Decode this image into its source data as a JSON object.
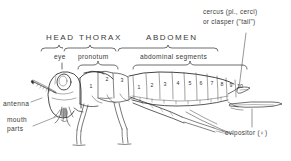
{
  "figure": {
    "background_color": "#ffffff",
    "ink_color": "#2f2f2f"
  },
  "region_labels": [
    {
      "text": "HEAD",
      "x": 46,
      "y": 38
    },
    {
      "text": "THORAX",
      "x": 79,
      "y": 38
    },
    {
      "text": "ABDOMEN",
      "x": 146,
      "y": 38
    }
  ],
  "sub_labels": [
    {
      "text": "eye",
      "x": 57,
      "y": 58
    },
    {
      "text": "pronotum",
      "x": 85,
      "y": 58
    },
    {
      "text": "abdominal segments",
      "x": 140,
      "y": 58
    }
  ],
  "side_labels": [
    {
      "text": "antenna",
      "x": 4,
      "y": 104
    },
    {
      "text": "mouth",
      "x": 8,
      "y": 119
    },
    {
      "text": "parts",
      "x": 8,
      "y": 128
    }
  ],
  "callouts": {
    "cercus_line1": "cercus (pl., cerci)",
    "cercus_line2": "or clasper (\"tail\")",
    "ovipositor": "ovipositor (♀)"
  },
  "thorax_segments": [
    {
      "label": "1",
      "x": 91,
      "y": 86
    },
    {
      "label": "2",
      "x": 107,
      "y": 79
    },
    {
      "label": "3",
      "x": 122,
      "y": 80
    }
  ],
  "abdominal_segments": [
    {
      "label": "1",
      "x": 139,
      "y": 87
    },
    {
      "label": "2",
      "x": 152,
      "y": 85
    },
    {
      "label": "3",
      "x": 165,
      "y": 84
    },
    {
      "label": "4",
      "x": 178,
      "y": 83
    },
    {
      "label": "5",
      "x": 190,
      "y": 83
    },
    {
      "label": "6",
      "x": 201,
      "y": 83
    },
    {
      "label": "7",
      "x": 212,
      "y": 83
    },
    {
      "label": "8",
      "x": 222,
      "y": 84
    },
    {
      "label": "9",
      "x": 231,
      "y": 85
    },
    {
      "label": "10",
      "x": 240,
      "y": 86
    }
  ]
}
